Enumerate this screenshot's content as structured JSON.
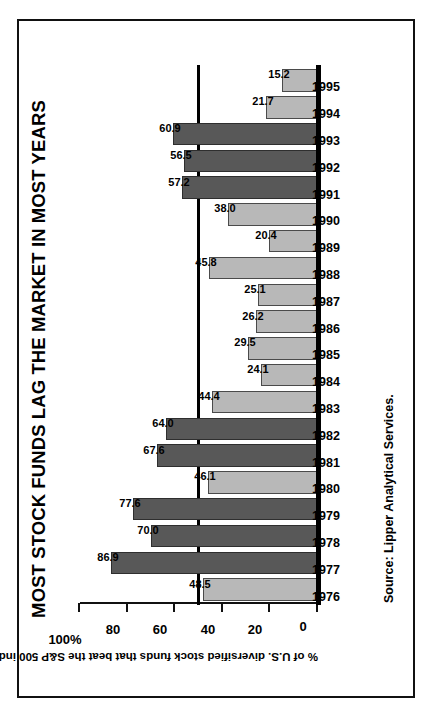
{
  "chart_data": {
    "type": "bar",
    "title": "MOST STOCK FUNDS LAG THE MARKET IN MOST YEARS",
    "xlabel": "",
    "ylabel": "% of U.S. diversified stock funds that beat the S&P 500 index",
    "ylim": [
      0,
      100
    ],
    "ytick_labels": [
      "100%",
      "80",
      "60",
      "40",
      "20",
      "0"
    ],
    "ytick_values": [
      100,
      80,
      60,
      40,
      20,
      0
    ],
    "grid": false,
    "legend": null,
    "threshold": 50,
    "orientation": "vertical-bars-rotated-90ccw",
    "categories": [
      "1976",
      "1977",
      "1978",
      "1979",
      "1980",
      "1981",
      "1982",
      "1983",
      "1984",
      "1985",
      "1986",
      "1987",
      "1988",
      "1989",
      "1990",
      "1991",
      "1992",
      "1993",
      "1994",
      "1995"
    ],
    "values": [
      48.5,
      86.9,
      70.0,
      77.6,
      46.1,
      67.6,
      64.0,
      44.4,
      24.1,
      29.5,
      26.2,
      25.1,
      45.8,
      20.4,
      38.0,
      57.2,
      56.5,
      60.9,
      21.7,
      15.2
    ],
    "value_labels": [
      "48.5",
      "86.9",
      "70.0",
      "77.6",
      "46.1",
      "67.6",
      "64.0",
      "44.4",
      "24.1",
      "29.5",
      "26.2",
      "25.1",
      "45.8",
      "20.4",
      "38.0",
      "57.2",
      "56.5",
      "60.9",
      "21.7",
      "15.2"
    ],
    "bar_shades": [
      "light",
      "dark",
      "dark",
      "dark",
      "light",
      "dark",
      "dark",
      "light",
      "light",
      "light",
      "light",
      "light",
      "light",
      "light",
      "light",
      "dark",
      "dark",
      "dark",
      "light",
      "light"
    ],
    "colors": {
      "bar_light": "#b8b8b8",
      "bar_dark": "#585858",
      "axis": "#111111",
      "text": "#000000",
      "background": "#ffffff"
    }
  },
  "source": {
    "label": "Source:",
    "text": " Lipper Analytical Services."
  }
}
